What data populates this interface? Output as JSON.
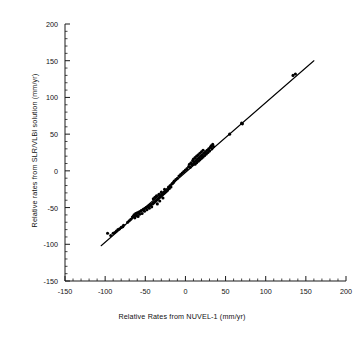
{
  "chart_data": {
    "type": "scatter",
    "title": "",
    "xlabel": "Relative Rates from NUVEL-1 (mm/yr)",
    "ylabel": "Relative rates from SLR/VLBI solution (mm/yr)",
    "xlim": [
      -150,
      200
    ],
    "ylim": [
      -150,
      200
    ],
    "xticks": [
      -150,
      -100,
      -50,
      0,
      50,
      100,
      150,
      200
    ],
    "yticks": [
      -150,
      -100,
      -50,
      0,
      50,
      100,
      150,
      200
    ],
    "xtick_labels": [
      "-150",
      "-100",
      "-50",
      "0",
      "50",
      "100",
      "150",
      "200"
    ],
    "ytick_labels": [
      "-150",
      "-100",
      "-50",
      "0",
      "50",
      "100",
      "150",
      "200"
    ],
    "minor_tick_step": 10,
    "grid": false,
    "legend": "none",
    "marker": {
      "shape": "circle",
      "color": "#000000",
      "size_px": 2.4
    },
    "fit_line": {
      "label": "1:1 regression line",
      "color": "#000000",
      "width_px": 1.1,
      "x_start": -105,
      "y_start": -102,
      "x_end": 160,
      "y_end": 150
    },
    "series": [
      {
        "name": "Plate pair relative rates",
        "points": [
          [
            -97,
            -85
          ],
          [
            -93,
            -88
          ],
          [
            -90,
            -85
          ],
          [
            -88,
            -84
          ],
          [
            -86,
            -82
          ],
          [
            -84,
            -80
          ],
          [
            -82,
            -79
          ],
          [
            -80,
            -77
          ],
          [
            -78,
            -76
          ],
          [
            -77,
            -74
          ],
          [
            -72,
            -70
          ],
          [
            -70,
            -68
          ],
          [
            -68,
            -66
          ],
          [
            -66,
            -63
          ],
          [
            -65,
            -62
          ],
          [
            -64,
            -60
          ],
          [
            -63,
            -64
          ],
          [
            -62,
            -58
          ],
          [
            -61,
            -61
          ],
          [
            -60,
            -57
          ],
          [
            -59,
            -62
          ],
          [
            -58,
            -56
          ],
          [
            -57,
            -59
          ],
          [
            -56,
            -55
          ],
          [
            -55,
            -54
          ],
          [
            -54,
            -58
          ],
          [
            -53,
            -53
          ],
          [
            -52,
            -52
          ],
          [
            -51,
            -55
          ],
          [
            -50,
            -51
          ],
          [
            -49,
            -50
          ],
          [
            -48,
            -53
          ],
          [
            -47,
            -49
          ],
          [
            -46,
            -48
          ],
          [
            -45,
            -51
          ],
          [
            -44,
            -47
          ],
          [
            -43,
            -46
          ],
          [
            -42,
            -49
          ],
          [
            -41,
            -45
          ],
          [
            -40,
            -44
          ],
          [
            -40,
            -38
          ],
          [
            -39,
            -43
          ],
          [
            -38,
            -42
          ],
          [
            -38,
            -36
          ],
          [
            -37,
            -41
          ],
          [
            -36,
            -40
          ],
          [
            -36,
            -34
          ],
          [
            -35,
            -39
          ],
          [
            -35,
            -45
          ],
          [
            -34,
            -38
          ],
          [
            -33,
            -37
          ],
          [
            -33,
            -32
          ],
          [
            -32,
            -36
          ],
          [
            -32,
            -41
          ],
          [
            -31,
            -35
          ],
          [
            -30,
            -34
          ],
          [
            -30,
            -29
          ],
          [
            -29,
            -33
          ],
          [
            -28,
            -32
          ],
          [
            -28,
            -37
          ],
          [
            -27,
            -31
          ],
          [
            -26,
            -30
          ],
          [
            -26,
            -25
          ],
          [
            -25,
            -29
          ],
          [
            -24,
            -28
          ],
          [
            -23,
            -27
          ],
          [
            -22,
            -26
          ],
          [
            -21,
            -22
          ],
          [
            -20,
            -24
          ],
          [
            -19,
            -20
          ],
          [
            -18,
            -22
          ],
          [
            -17,
            -18
          ],
          [
            -16,
            -17
          ],
          [
            -15,
            -16
          ],
          [
            -14,
            -14
          ],
          [
            -12,
            -12
          ],
          [
            -10,
            -10
          ],
          [
            -8,
            -7
          ],
          [
            -6,
            -5
          ],
          [
            -4,
            -3
          ],
          [
            -2,
            -1
          ],
          [
            0,
            1
          ],
          [
            2,
            3
          ],
          [
            4,
            6
          ],
          [
            5,
            9
          ],
          [
            6,
            5
          ],
          [
            7,
            11
          ],
          [
            8,
            8
          ],
          [
            9,
            14
          ],
          [
            10,
            10
          ],
          [
            10,
            16
          ],
          [
            11,
            12
          ],
          [
            12,
            18
          ],
          [
            12,
            9
          ],
          [
            13,
            14
          ],
          [
            14,
            20
          ],
          [
            14,
            11
          ],
          [
            15,
            16
          ],
          [
            16,
            22
          ],
          [
            16,
            13
          ],
          [
            17,
            18
          ],
          [
            18,
            24
          ],
          [
            18,
            15
          ],
          [
            19,
            20
          ],
          [
            20,
            17
          ],
          [
            20,
            26
          ],
          [
            21,
            22
          ],
          [
            22,
            19
          ],
          [
            22,
            28
          ],
          [
            23,
            24
          ],
          [
            24,
            21
          ],
          [
            25,
            26
          ],
          [
            26,
            23
          ],
          [
            27,
            28
          ],
          [
            28,
            25
          ],
          [
            29,
            30
          ],
          [
            30,
            27
          ],
          [
            31,
            32
          ],
          [
            32,
            34
          ],
          [
            33,
            30
          ],
          [
            34,
            36
          ],
          [
            35,
            33
          ],
          [
            55,
            50
          ],
          [
            70,
            65
          ],
          [
            71,
            64
          ],
          [
            134,
            130
          ],
          [
            137,
            132
          ]
        ]
      }
    ]
  },
  "figure": {
    "background_color": "#ffffff",
    "axis_color": "#1a1a1a",
    "marker_color": "#000000"
  }
}
